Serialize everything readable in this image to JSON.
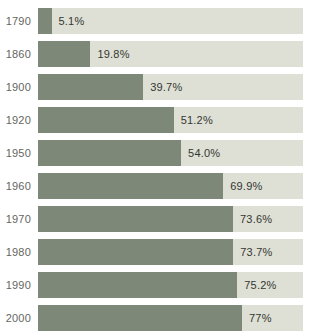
{
  "chart_data": {
    "type": "bar",
    "orientation": "horizontal",
    "title": "",
    "xlabel": "",
    "ylabel": "",
    "xlim": [
      0,
      100
    ],
    "grid": false,
    "legend": "none",
    "categories": [
      "1790",
      "1860",
      "1900",
      "1920",
      "1950",
      "1960",
      "1970",
      "1980",
      "1990",
      "2000"
    ],
    "values": [
      5.1,
      19.8,
      39.7,
      51.2,
      54.0,
      69.9,
      73.6,
      73.7,
      75.2,
      77
    ],
    "value_labels": [
      "5.1%",
      "19.8%",
      "39.7%",
      "51.2%",
      "54.0%",
      "69.9%",
      "73.6%",
      "73.7%",
      "75.2%",
      "77%"
    ],
    "colors": {
      "bar_fill": "#7e8878",
      "bar_track": "#dee0d5",
      "year_label": "#64665f",
      "value_label": "#343732",
      "background": "#ffffff"
    }
  }
}
